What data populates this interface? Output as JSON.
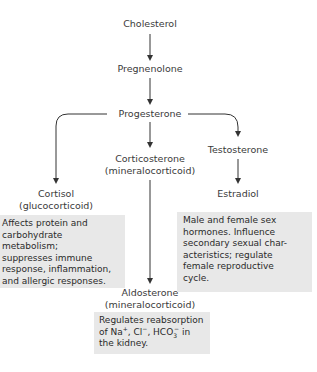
{
  "nodes": {
    "cholesterol": "Cholesterol",
    "pregnenolone": "Pregnenolone",
    "progesterone": "Progesterone",
    "testosterone": "Testosterone",
    "corticosterone": "Corticosterone",
    "corticosterone_class": "(mineralocorticoid)",
    "cortisol": "Cortisol",
    "cortisol_class": "(glucocorticoid)",
    "estradiol": "Estradiol",
    "aldosterone": "Aldosterone",
    "aldosterone_class": "(mineralocorticoid)"
  },
  "descriptions": {
    "cortisol": [
      "Affects protein and",
      "carbohydrate metabolism;",
      "suppresses immune",
      "response, inflammation,",
      "and allergic responses."
    ],
    "estradiol": [
      "Male and female sex",
      "hormones. Influence",
      "secondary sexual char-",
      "acteristics; regulate",
      "female reproductive",
      "cycle."
    ],
    "aldosterone": {
      "line1": "Regulates reabsorption",
      "line2_prefix": "of Na",
      "na_charge": "+",
      "cl": ", Cl",
      "cl_charge": "−",
      "hco": ", HCO",
      "hco_sub": "3",
      "hco_charge": "−",
      "line2_suffix": " in",
      "line3": "the kidney."
    }
  },
  "colors": {
    "box_fill": "#e8e8e8",
    "arrow": "#333333",
    "text": "#3a3a3a"
  }
}
